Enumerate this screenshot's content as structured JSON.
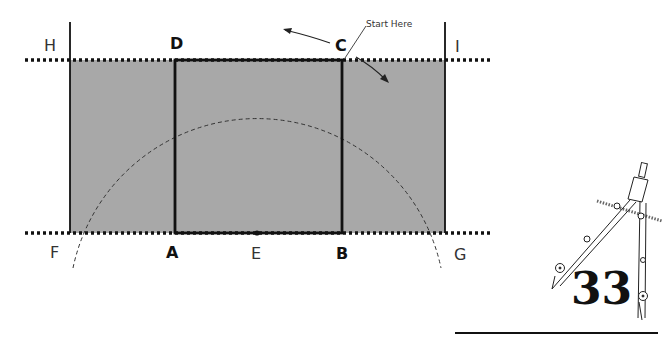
{
  "diagram": {
    "colors": {
      "fill": "#a8a8a8",
      "stroke": "#111111",
      "dash": "#333333"
    },
    "points": {
      "H": "H",
      "I": "I",
      "F": "F",
      "G": "G",
      "A": "A",
      "B": "B",
      "C": "C",
      "D": "D",
      "E": "E"
    },
    "annotation": "Start Here",
    "page_number": "33"
  }
}
